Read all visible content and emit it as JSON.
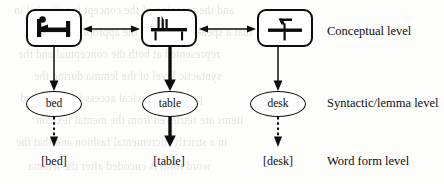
{
  "diagram": {
    "columns": [
      {
        "id": "bed",
        "concept_icon": "bed-icon",
        "lemma": "bed",
        "word_form": "[bed]",
        "box_to_lemma_arrow": "solid-thin",
        "lemma_to_form_arrow": "dashed"
      },
      {
        "id": "table",
        "concept_icon": "table-icon",
        "lemma": "table",
        "word_form": "[table]",
        "box_to_lemma_arrow": "solid-thick",
        "lemma_to_form_arrow": "solid-thick"
      },
      {
        "id": "desk",
        "concept_icon": "desk-icon",
        "lemma": "desk",
        "word_form": "[desk]",
        "box_to_lemma_arrow": "solid-thin",
        "lemma_to_form_arrow": "dashed"
      }
    ],
    "levels": {
      "conceptual": "Conceptual level",
      "syntactic": "Syntactic/lemma level",
      "word_form": "Word form level"
    },
    "lateral_links": [
      {
        "from": "bed",
        "to": "table",
        "style": "double-headed"
      },
      {
        "from": "table",
        "to": "desk",
        "style": "double-headed"
      }
    ],
    "colors": {
      "ink": "#0d0d0d",
      "paper": "#fdfdfc",
      "bleed_text": "#6c6256"
    }
  },
  "scan_artifacts": {
    "bleed_lines": [
      "and the meaning of the concept is activated in",
      "that a speaker selecting the appropriate lexical",
      "represented at both the conceptual and the",
      "syntactic level of the lemma during the",
      "process of lexical access it is assumed",
      "items are retrieved from the mental lexicon",
      "in a strictly incremental fashion and that the",
      "word form is encoded after the lemma"
    ]
  }
}
